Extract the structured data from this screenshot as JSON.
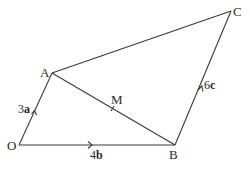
{
  "diagram": {
    "points": {
      "O": {
        "label": "O",
        "x": 19,
        "y": 145
      },
      "A": {
        "label": "A",
        "x": 52,
        "y": 73
      },
      "B": {
        "label": "B",
        "x": 175,
        "y": 145
      },
      "C": {
        "label": "C",
        "x": 231,
        "y": 11
      },
      "M": {
        "label": "M",
        "x": 113,
        "y": 109
      }
    },
    "vectors": {
      "OA": {
        "coef": "3",
        "sym": "a"
      },
      "OB": {
        "coef": "4",
        "sym": "b"
      },
      "BC": {
        "coef": "6",
        "sym": "c"
      }
    }
  }
}
